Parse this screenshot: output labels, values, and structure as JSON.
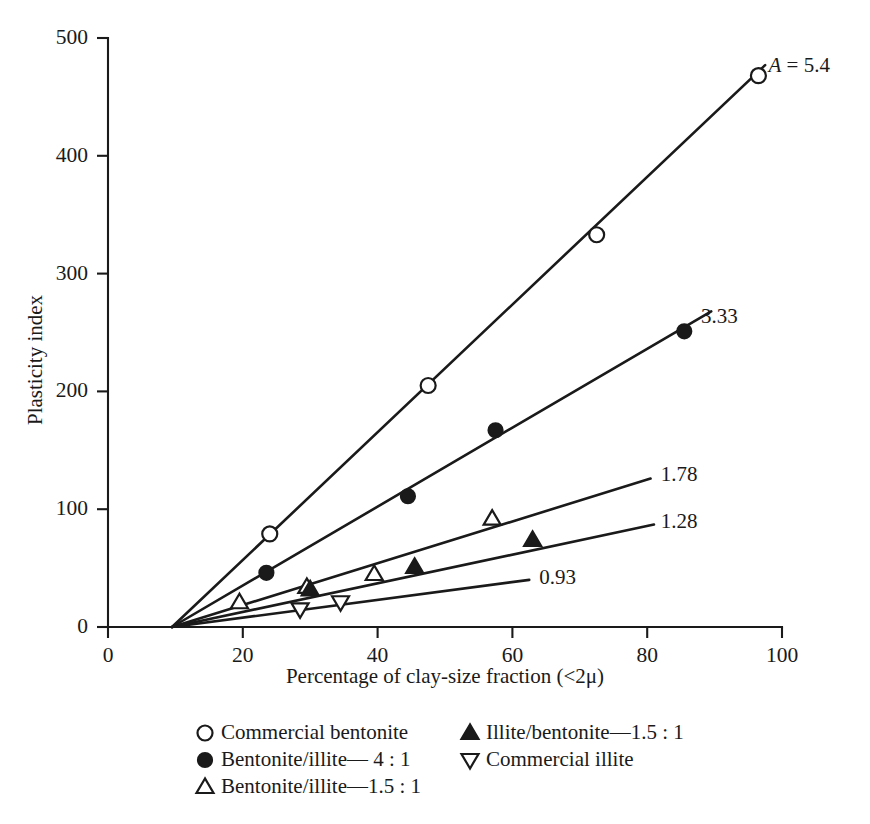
{
  "chart_data": {
    "type": "line",
    "title": "",
    "xlabel": "Percentage of clay-size fraction (<2μ)",
    "ylabel": "Plasticity index",
    "xlim": [
      0,
      100
    ],
    "ylim": [
      0,
      500
    ],
    "xticks": [
      0,
      20,
      40,
      60,
      80,
      100
    ],
    "yticks": [
      0,
      100,
      200,
      300,
      400,
      500
    ],
    "xtick_labels": [
      "0",
      "20",
      "40",
      "60",
      "80",
      "100"
    ],
    "ytick_labels": [
      "0",
      "100",
      "200",
      "300",
      "400",
      "500"
    ],
    "grid": false,
    "legend_position": "below-axes",
    "annotations": [
      {
        "text": "A = 5.4",
        "italic_prefix": "A",
        "rest": " = 5.4",
        "x": 98,
        "y": 475
      },
      {
        "text": "3.33",
        "x": 88,
        "y": 262
      },
      {
        "text": "1.78",
        "x": 82,
        "y": 128
      },
      {
        "text": "1.28",
        "x": 82,
        "y": 88
      },
      {
        "text": "0.93",
        "x": 64,
        "y": 41
      }
    ],
    "series": [
      {
        "name": "Commercial bentonite",
        "activity": 5.4,
        "marker": "open-circle",
        "line_x": [
          9.5,
          97.5
        ],
        "line_y": [
          0,
          477
        ],
        "points_x": [
          24,
          47.5,
          72.5,
          96.5
        ],
        "points_y": [
          79,
          205,
          333,
          468
        ]
      },
      {
        "name": "Bentonite/illite—4 : 1",
        "activity": 3.33,
        "marker": "filled-circle",
        "line_x": [
          9.5,
          89.5
        ],
        "line_y": [
          0,
          268
        ],
        "points_x": [
          23.5,
          44.5,
          57.5,
          85.5
        ],
        "points_y": [
          46,
          111,
          167,
          251
        ]
      },
      {
        "name": "Bentonite/illite—1.5 : 1",
        "activity": 1.78,
        "marker": "open-triangle-up",
        "line_x": [
          9.5,
          80.5
        ],
        "line_y": [
          0,
          126
        ],
        "points_x": [
          19.5,
          29.5,
          39.5,
          57
        ],
        "points_y": [
          21,
          34,
          45,
          92
        ]
      },
      {
        "name": "Illite/bentonite—1.5 : 1",
        "activity": 1.28,
        "marker": "filled-triangle-up",
        "line_x": [
          9.5,
          81
        ],
        "line_y": [
          0,
          87
        ],
        "points_x": [
          30,
          45.5,
          63
        ],
        "points_y": [
          32,
          51,
          74
        ]
      },
      {
        "name": "Commercial illite",
        "activity": 0.93,
        "marker": "open-triangle-down",
        "line_x": [
          9.5,
          62.5
        ],
        "line_y": [
          0,
          40
        ],
        "points_x": [
          28.5,
          34.5
        ],
        "points_y": [
          15,
          21
        ]
      }
    ],
    "legend": [
      {
        "marker": "open-circle",
        "label": "Commercial bentonite",
        "col": 0,
        "row": 0
      },
      {
        "marker": "filled-circle",
        "label": "Bentonite/illite— 4 : 1",
        "col": 0,
        "row": 1
      },
      {
        "marker": "open-triangle-up",
        "label": "Bentonite/illite—1.5 : 1",
        "col": 0,
        "row": 2
      },
      {
        "marker": "filled-triangle-up",
        "label": "Illite/bentonite—1.5 : 1",
        "col": 1,
        "row": 0
      },
      {
        "marker": "open-triangle-down",
        "label": "Commercial illite",
        "col": 1,
        "row": 1
      }
    ]
  }
}
